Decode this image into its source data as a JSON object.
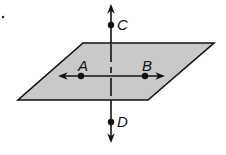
{
  "diagram": {
    "type": "geometry",
    "plane": {
      "fill": "#c9c9c9",
      "stroke": "#111111",
      "corners": [
        [
          83,
          43
        ],
        [
          214,
          43
        ],
        [
          148,
          100
        ],
        [
          18,
          100
        ]
      ]
    },
    "points": {
      "A": {
        "label": "A",
        "x": 81,
        "y": 76
      },
      "B": {
        "label": "B",
        "x": 145,
        "y": 76
      },
      "C": {
        "label": "C",
        "x": 111,
        "y": 25
      },
      "D": {
        "label": "D",
        "x": 111,
        "y": 122
      }
    },
    "lines": [
      {
        "name": "line-AB",
        "through": [
          "A",
          "B"
        ],
        "arrows": "both"
      },
      {
        "name": "line-CD",
        "through": [
          "C",
          "D"
        ],
        "arrows": "both",
        "hidden_part_dashed": true
      }
    ],
    "stray_mark": {
      "x": 3,
      "y": 17
    }
  }
}
